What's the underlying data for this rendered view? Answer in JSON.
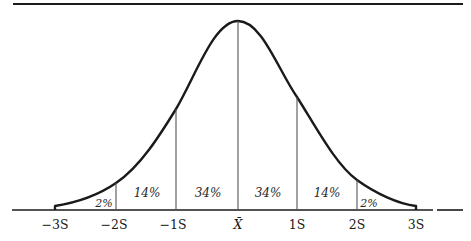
{
  "diagram": {
    "axis_labels": [
      "−3S",
      "−2S",
      "−1S",
      "X̄",
      "1S",
      "2S",
      "3S"
    ],
    "region_labels": [
      "2%",
      "14%",
      "34%",
      "34%",
      "14%",
      "2%"
    ],
    "line_color": "#1a1a1a"
  }
}
